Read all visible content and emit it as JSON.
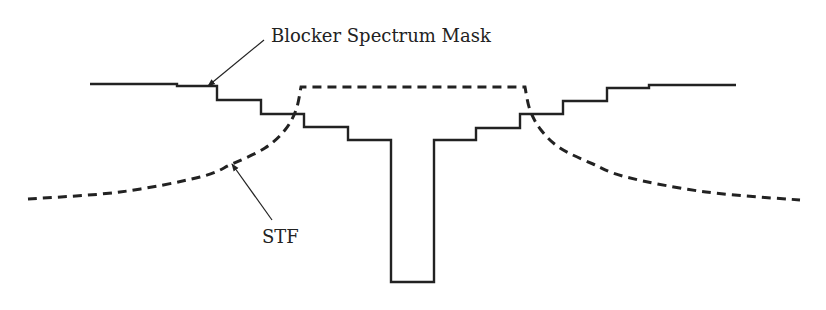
{
  "figure": {
    "width": 826,
    "height": 310,
    "background": "#ffffff",
    "stroke_color": "#222222"
  },
  "labels": {
    "blocker_mask": "Blocker Spectrum Mask",
    "stf": "STF"
  },
  "chart_data": {
    "type": "line",
    "title": "",
    "xlabel": "",
    "ylabel": "",
    "grid": false,
    "legend": "none (inline annotations with arrows)",
    "series": [
      {
        "name": "Blocker Spectrum Mask",
        "style": "solid step",
        "points_px": [
          [
            90,
            84
          ],
          [
            177,
            84
          ],
          [
            177,
            86
          ],
          [
            217,
            86
          ],
          [
            217,
            100
          ],
          [
            261,
            100
          ],
          [
            261,
            114
          ],
          [
            304,
            114
          ],
          [
            304,
            127
          ],
          [
            348,
            127
          ],
          [
            348,
            140
          ],
          [
            391,
            140
          ],
          [
            391,
            282
          ],
          [
            434,
            282
          ],
          [
            434,
            140
          ],
          [
            476,
            140
          ],
          [
            476,
            128
          ],
          [
            520,
            128
          ],
          [
            520,
            114
          ],
          [
            563,
            114
          ],
          [
            563,
            101
          ],
          [
            607,
            101
          ],
          [
            607,
            88
          ],
          [
            649,
            88
          ],
          [
            649,
            85
          ],
          [
            736,
            85
          ]
        ]
      },
      {
        "name": "STF",
        "style": "dashed curve",
        "points_px": [
          [
            28,
            199
          ],
          [
            120,
            192
          ],
          [
            200,
            177
          ],
          [
            232,
            164
          ],
          [
            265,
            148
          ],
          [
            285,
            130
          ],
          [
            296,
            110
          ],
          [
            301,
            87
          ],
          [
            525,
            87
          ],
          [
            530,
            110
          ],
          [
            541,
            130
          ],
          [
            560,
            148
          ],
          [
            593,
            164
          ],
          [
            626,
            177
          ],
          [
            706,
            192
          ],
          [
            800,
            200
          ]
        ]
      }
    ],
    "annotations": [
      {
        "text": "Blocker Spectrum Mask",
        "arrow_from": [
          264,
          40
        ],
        "arrow_to": [
          208,
          86
        ]
      },
      {
        "text": "STF",
        "arrow_from": [
          272,
          220
        ],
        "arrow_to": [
          232,
          164
        ]
      }
    ]
  }
}
